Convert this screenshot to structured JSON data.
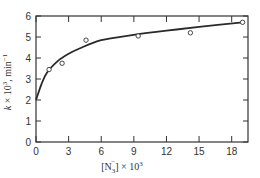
{
  "chart_data": {
    "type": "scatter",
    "title": "",
    "xlabel": "[N3-] × 10^3",
    "ylabel": "k × 10^3, min^-1",
    "xlabel_parts": {
      "open": "[N",
      "sub": "3",
      "sup": "−",
      "close": "] × 10",
      "exp": "3"
    },
    "ylabel_parts": {
      "italic": "k",
      "mid": " × 10",
      "exp": "3",
      "tail": ", min",
      "exp2": "−1"
    },
    "xlim": [
      0,
      19.5
    ],
    "ylim": [
      0,
      6
    ],
    "xticks": [
      0,
      3,
      6,
      9,
      12,
      15,
      18
    ],
    "yticks": [
      0,
      1,
      2,
      3,
      4,
      5,
      6
    ],
    "grid": false,
    "legend": null,
    "series": [
      {
        "name": "observed",
        "kind": "points",
        "marker": "open-circle",
        "x": [
          1.2,
          2.4,
          4.6,
          9.4,
          14.2,
          19.0
        ],
        "y": [
          3.45,
          3.75,
          4.85,
          5.05,
          5.2,
          5.7
        ]
      },
      {
        "name": "fitted curve",
        "kind": "line",
        "x": [
          0,
          0.5,
          1,
          2,
          3,
          4,
          6,
          9,
          12,
          15,
          19
        ],
        "y": [
          2.0,
          2.75,
          3.3,
          3.85,
          4.2,
          4.45,
          4.85,
          5.1,
          5.3,
          5.48,
          5.7
        ]
      }
    ]
  }
}
